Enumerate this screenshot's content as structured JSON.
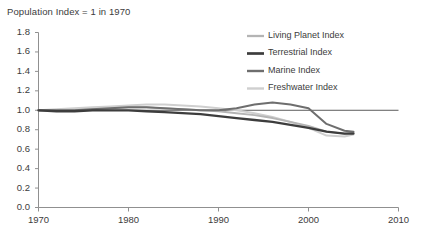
{
  "chart_data": {
    "type": "line",
    "title": "Population Index = 1 in 1970",
    "xlabel": "",
    "ylabel": "",
    "xlim": [
      1970,
      2010
    ],
    "ylim": [
      0.0,
      1.8
    ],
    "xticks": [
      "1970",
      "1980",
      "1990",
      "2000",
      "2010"
    ],
    "yticks": [
      "0.0",
      "0.2",
      "0.4",
      "0.6",
      "0.8",
      "1.0",
      "1.2",
      "1.4",
      "1.6",
      "1.8"
    ],
    "grid": false,
    "legend_position": "top-right",
    "reference_line": 1.0,
    "x": [
      1970,
      1972,
      1974,
      1976,
      1978,
      1980,
      1982,
      1984,
      1986,
      1988,
      1990,
      1992,
      1994,
      1996,
      1998,
      2000,
      2002,
      2004,
      2005
    ],
    "series": [
      {
        "name": "Living Planet Index",
        "color": "#b4b4b4",
        "width": 1.9,
        "values": [
          1.0,
          1.0,
          1.0,
          1.01,
          1.02,
          1.03,
          1.03,
          1.02,
          1.01,
          1.0,
          0.99,
          0.97,
          0.95,
          0.92,
          0.88,
          0.84,
          0.78,
          0.76,
          0.77
        ]
      },
      {
        "name": "Terrestrial Index",
        "color": "#3d3d3d",
        "width": 2.3,
        "values": [
          1.0,
          0.99,
          0.99,
          1.0,
          1.0,
          1.0,
          0.99,
          0.98,
          0.97,
          0.96,
          0.94,
          0.92,
          0.9,
          0.88,
          0.85,
          0.82,
          0.78,
          0.76,
          0.76
        ]
      },
      {
        "name": "Marine Index",
        "color": "#6e6e6e",
        "width": 2.0,
        "values": [
          1.0,
          1.0,
          1.0,
          1.01,
          1.02,
          1.03,
          1.03,
          1.02,
          1.01,
          1.0,
          1.0,
          1.02,
          1.06,
          1.08,
          1.06,
          1.02,
          0.86,
          0.79,
          0.78
        ]
      },
      {
        "name": "Freshwater Index",
        "color": "#cfcfcf",
        "width": 2.0,
        "values": [
          1.0,
          1.01,
          1.02,
          1.03,
          1.04,
          1.05,
          1.06,
          1.06,
          1.05,
          1.04,
          1.02,
          1.0,
          0.97,
          0.93,
          0.88,
          0.82,
          0.74,
          0.73,
          0.75
        ]
      }
    ]
  }
}
